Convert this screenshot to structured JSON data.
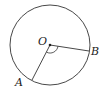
{
  "diagram": {
    "type": "geometry-circle",
    "labels": {
      "center": "O",
      "point_a": "A",
      "point_b": "B"
    },
    "colors": {
      "stroke": "#333333",
      "background": "#ffffff"
    },
    "elements": [
      "circle centered at O",
      "radius OA",
      "radius OB",
      "angle arc AOB at O"
    ]
  }
}
